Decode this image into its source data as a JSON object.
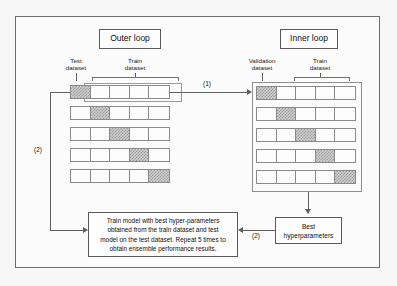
{
  "diagram": {
    "outer_loop": {
      "chip_label": "Outer loop",
      "test_caption": "Test\ndataset",
      "test_caption_line1": "Test",
      "test_caption_line2": "dataset",
      "train_caption_line1": "Train",
      "train_caption_line2": "dataset",
      "folds": 5,
      "cells_per_fold": 5,
      "held_out_index": [
        0,
        1,
        2,
        3,
        4
      ]
    },
    "inner_loop": {
      "chip_label": "Inner loop",
      "validation_caption_line1": "Validation",
      "validation_caption_line2": "dataset",
      "train_caption_line1": "Train",
      "train_caption_line2": "dataset",
      "folds": 5,
      "cells_per_fold": 5,
      "held_out_index": [
        0,
        1,
        2,
        3,
        4
      ]
    },
    "arrows": {
      "step1_label": "(1)",
      "step2_left_label": "(2)",
      "step2_right_label": "(2)"
    },
    "best_hp_box": {
      "line1": "Best",
      "line2": "hyperparameters"
    },
    "bottom_box": {
      "line1": "Train model with best hyper-parameters",
      "line2": "obtained from the train dataset and test",
      "line3": "model on the test dataset. Repeat 5 times to",
      "line4": "obtain ensemble performance results."
    }
  },
  "colors": {
    "frame_border": "#6b6b6b",
    "line": "#5e5e5e",
    "cell_border": "#8a8a8a",
    "hatch_fill": "#cfcfcf",
    "page_background": "#f6f6f6",
    "panel_background": "#fbfbfb"
  }
}
